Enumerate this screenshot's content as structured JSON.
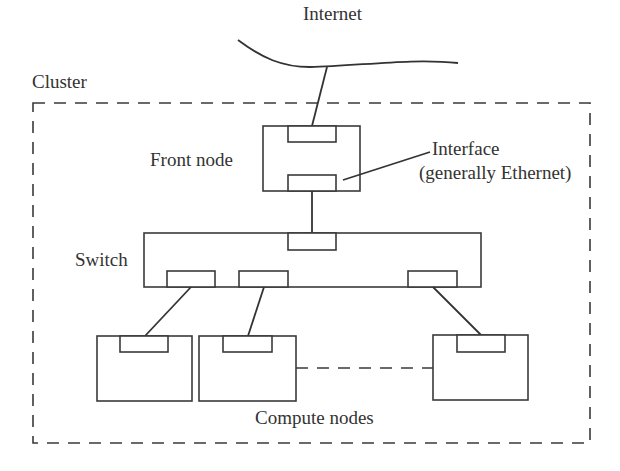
{
  "diagram": {
    "labels": {
      "internet": "Internet",
      "cluster": "Cluster",
      "front_node": "Front node",
      "interface_line1": "Interface",
      "interface_line2": "(generally Ethernet)",
      "switch": "Switch",
      "compute_nodes": "Compute nodes"
    },
    "colors": {
      "stroke": "#333333",
      "text": "#333333",
      "background": "#ffffff"
    },
    "nodes": [
      {
        "id": "internet",
        "label": "Internet",
        "type": "network-cloud"
      },
      {
        "id": "front-node",
        "label": "Front node",
        "interfaces": 2
      },
      {
        "id": "switch",
        "label": "Switch",
        "interfaces": 4
      },
      {
        "id": "compute-node-1",
        "label": "",
        "interfaces": 1
      },
      {
        "id": "compute-node-2",
        "label": "",
        "interfaces": 1
      },
      {
        "id": "compute-node-n",
        "label": "",
        "interfaces": 1
      }
    ],
    "edges": [
      {
        "from": "internet",
        "to": "front-node",
        "style": "solid"
      },
      {
        "from": "front-node",
        "to": "switch",
        "style": "solid"
      },
      {
        "from": "switch",
        "to": "compute-node-1",
        "style": "solid"
      },
      {
        "from": "switch",
        "to": "compute-node-2",
        "style": "solid"
      },
      {
        "from": "switch",
        "to": "compute-node-n",
        "style": "solid"
      },
      {
        "from": "compute-node-2",
        "to": "compute-node-n",
        "style": "dashed",
        "meaning": "more nodes"
      }
    ],
    "groups": [
      {
        "id": "cluster",
        "label": "Cluster",
        "style": "dashed",
        "contains": [
          "front-node",
          "switch",
          "compute-node-1",
          "compute-node-2",
          "compute-node-n"
        ]
      }
    ]
  }
}
